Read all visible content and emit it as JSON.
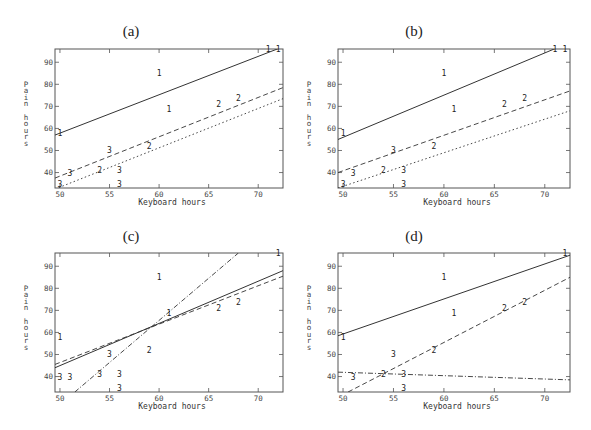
{
  "figure": {
    "panels": [
      {
        "id": "a",
        "title": "(a)"
      },
      {
        "id": "b",
        "title": "(b)"
      },
      {
        "id": "c",
        "title": "(c)"
      },
      {
        "id": "d",
        "title": "(d)"
      }
    ],
    "xlabel": "Keyboard hours",
    "ylabel": "Pain hours"
  },
  "chart_data": [
    {
      "type": "scatter",
      "title": "(a)",
      "xlabel": "Keyboard hours",
      "ylabel": "Pain hours",
      "xlim": [
        49.5,
        72.5
      ],
      "ylim": [
        33,
        96
      ],
      "xticks": [
        50,
        55,
        60,
        65,
        70
      ],
      "yticks": [
        40,
        50,
        60,
        70,
        80,
        90
      ],
      "points": [
        {
          "group": "1",
          "x": 50,
          "y": 58
        },
        {
          "group": "1",
          "x": 60,
          "y": 85
        },
        {
          "group": "1",
          "x": 61,
          "y": 69
        },
        {
          "group": "1",
          "x": 71,
          "y": 96
        },
        {
          "group": "1",
          "x": 72,
          "y": 96
        },
        {
          "group": "2",
          "x": 54,
          "y": 41
        },
        {
          "group": "2",
          "x": 59,
          "y": 52
        },
        {
          "group": "2",
          "x": 66,
          "y": 71
        },
        {
          "group": "2",
          "x": 68,
          "y": 74
        },
        {
          "group": "3",
          "x": 50,
          "y": 33
        },
        {
          "group": "3",
          "x": 51,
          "y": 40
        },
        {
          "group": "3",
          "x": 55,
          "y": 50
        },
        {
          "group": "3",
          "x": 56,
          "y": 41
        },
        {
          "group": "3",
          "x": 56,
          "y": 34
        }
      ],
      "series": [
        {
          "name": "1",
          "style": "solid",
          "x": [
            49.5,
            72.5
          ],
          "y": [
            57,
            97
          ]
        },
        {
          "name": "2",
          "style": "dashed",
          "x": [
            49.5,
            72.5
          ],
          "y": [
            37.5,
            78.5
          ]
        },
        {
          "name": "3",
          "style": "dotted",
          "x": [
            49.5,
            72.5
          ],
          "y": [
            32.5,
            73.5
          ]
        }
      ]
    },
    {
      "type": "scatter",
      "title": "(b)",
      "xlabel": "Keyboard hours",
      "ylabel": "Pain hours",
      "xlim": [
        49.5,
        72.5
      ],
      "ylim": [
        33,
        96
      ],
      "xticks": [
        50,
        55,
        60,
        65,
        70
      ],
      "yticks": [
        40,
        50,
        60,
        70,
        80,
        90
      ],
      "points": [
        {
          "group": "1",
          "x": 50,
          "y": 58
        },
        {
          "group": "1",
          "x": 60,
          "y": 85
        },
        {
          "group": "1",
          "x": 61,
          "y": 69
        },
        {
          "group": "1",
          "x": 71,
          "y": 96
        },
        {
          "group": "1",
          "x": 72,
          "y": 96
        },
        {
          "group": "2",
          "x": 54,
          "y": 41
        },
        {
          "group": "2",
          "x": 59,
          "y": 52
        },
        {
          "group": "2",
          "x": 66,
          "y": 71
        },
        {
          "group": "2",
          "x": 68,
          "y": 74
        },
        {
          "group": "3",
          "x": 50,
          "y": 33
        },
        {
          "group": "3",
          "x": 51,
          "y": 40
        },
        {
          "group": "3",
          "x": 55,
          "y": 50
        },
        {
          "group": "3",
          "x": 56,
          "y": 41
        },
        {
          "group": "3",
          "x": 56,
          "y": 34
        }
      ],
      "series": [
        {
          "name": "1",
          "style": "solid",
          "x": [
            49.5,
            72.5
          ],
          "y": [
            55,
            99
          ]
        },
        {
          "name": "2",
          "style": "dashed",
          "x": [
            49.5,
            72.5
          ],
          "y": [
            40,
            77
          ]
        },
        {
          "name": "3",
          "style": "dotted",
          "x": [
            49.5,
            72.5
          ],
          "y": [
            33,
            68
          ]
        }
      ]
    },
    {
      "type": "scatter",
      "title": "(c)",
      "xlabel": "Keyboard hours",
      "ylabel": "Pain hours",
      "xlim": [
        49.5,
        72.5
      ],
      "ylim": [
        33,
        96
      ],
      "xticks": [
        50,
        55,
        60,
        65,
        70
      ],
      "yticks": [
        40,
        50,
        60,
        70,
        80,
        90
      ],
      "points": [
        {
          "group": "1",
          "x": 50,
          "y": 58
        },
        {
          "group": "1",
          "x": 60,
          "y": 85
        },
        {
          "group": "1",
          "x": 61,
          "y": 69
        },
        {
          "group": "1",
          "x": 72,
          "y": 96
        },
        {
          "group": "2",
          "x": 59,
          "y": 52
        },
        {
          "group": "2",
          "x": 66,
          "y": 71
        },
        {
          "group": "2",
          "x": 68,
          "y": 74
        },
        {
          "group": "3",
          "x": 50,
          "y": 40
        },
        {
          "group": "3",
          "x": 51,
          "y": 40
        },
        {
          "group": "3",
          "x": 54,
          "y": 41
        },
        {
          "group": "3",
          "x": 55,
          "y": 50
        },
        {
          "group": "3",
          "x": 56,
          "y": 41
        },
        {
          "group": "3",
          "x": 56,
          "y": 34
        }
      ],
      "series": [
        {
          "name": "1",
          "style": "solid",
          "x": [
            49.5,
            72.5
          ],
          "y": [
            44,
            88
          ]
        },
        {
          "name": "2",
          "style": "dashed",
          "x": [
            49.5,
            72.5
          ],
          "y": [
            45.5,
            85.5
          ]
        },
        {
          "name": "3",
          "style": "dash-dot",
          "x": [
            51.5,
            68
          ],
          "y": [
            33,
            96
          ]
        }
      ]
    },
    {
      "type": "scatter",
      "title": "(d)",
      "xlabel": "Keyboard hours",
      "ylabel": "Pain hours",
      "xlim": [
        49.5,
        72.5
      ],
      "ylim": [
        33,
        96
      ],
      "xticks": [
        50,
        55,
        60,
        65,
        70
      ],
      "yticks": [
        40,
        50,
        60,
        70,
        80,
        90
      ],
      "points": [
        {
          "group": "1",
          "x": 50,
          "y": 58
        },
        {
          "group": "1",
          "x": 60,
          "y": 85
        },
        {
          "group": "1",
          "x": 61,
          "y": 69
        },
        {
          "group": "1",
          "x": 72,
          "y": 96
        },
        {
          "group": "2",
          "x": 54,
          "y": 41
        },
        {
          "group": "2",
          "x": 59,
          "y": 52
        },
        {
          "group": "2",
          "x": 66,
          "y": 71
        },
        {
          "group": "2",
          "x": 68,
          "y": 74
        },
        {
          "group": "3",
          "x": 51,
          "y": 40
        },
        {
          "group": "3",
          "x": 55,
          "y": 50
        },
        {
          "group": "3",
          "x": 56,
          "y": 41
        },
        {
          "group": "3",
          "x": 56,
          "y": 34
        }
      ],
      "series": [
        {
          "name": "1",
          "style": "solid",
          "x": [
            49.5,
            72.5
          ],
          "y": [
            58.5,
            95
          ]
        },
        {
          "name": "2",
          "style": "dashed",
          "x": [
            50.5,
            72.5
          ],
          "y": [
            33,
            85
          ]
        },
        {
          "name": "3",
          "style": "dash-dot",
          "x": [
            49.5,
            72.5
          ],
          "y": [
            42,
            38.5
          ]
        }
      ]
    }
  ]
}
